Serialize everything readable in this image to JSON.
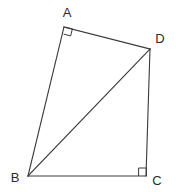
{
  "figure": {
    "width": 176,
    "height": 192,
    "background": "#ffffff",
    "stroke_color": "#3a3a3a",
    "label_color": "#2b2b2b"
  },
  "vertices": [
    {
      "id": "A",
      "label": "A",
      "x": 64,
      "y": 27,
      "label_x": 67,
      "label_y": 17
    },
    {
      "id": "D",
      "label": "D",
      "x": 150,
      "y": 49,
      "label_x": 160,
      "label_y": 43
    },
    {
      "id": "B",
      "label": "B",
      "x": 28,
      "y": 176,
      "label_x": 15,
      "label_y": 182
    },
    {
      "id": "C",
      "label": "C",
      "x": 146,
      "y": 176,
      "label_x": 157,
      "label_y": 185
    }
  ],
  "edges": [
    {
      "id": "AD",
      "from": "A",
      "to": "D",
      "points": "64,27 150,49"
    },
    {
      "id": "DC",
      "from": "D",
      "to": "C",
      "points": "150,49 146,176"
    },
    {
      "id": "CB",
      "from": "C",
      "to": "B",
      "points": "146,176 28,176"
    },
    {
      "id": "BA",
      "from": "B",
      "to": "A",
      "points": "28,176 64,27"
    },
    {
      "id": "BD",
      "from": "B",
      "to": "D",
      "points": "28,176 150,49"
    }
  ],
  "right_angles": [
    {
      "id": "angle-A",
      "at": "A",
      "points": "63.6,34.1 70.6,35.9 72.4,28.9 65.4,27.1"
    },
    {
      "id": "angle-C",
      "at": "C",
      "points": "138.6,176 138.6,168 146.4,168 146.4,176"
    }
  ]
}
